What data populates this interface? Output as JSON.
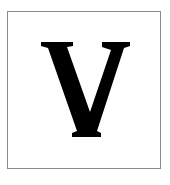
{
  "card": {
    "letter": "V",
    "border_color": "#8a8a8a",
    "letter_color": "#000000",
    "background": "#ffffff"
  }
}
